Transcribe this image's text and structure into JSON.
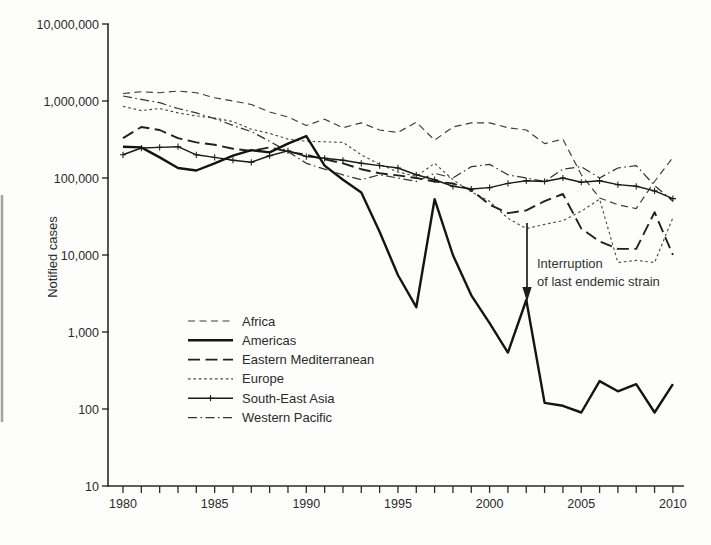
{
  "figure": {
    "background": "#fdfdfb",
    "ink": "#1a1a1a",
    "kind": "log-scale line chart of notified cases by WHO region, 1980-2010"
  },
  "y_axis": {
    "label": "Notified cases",
    "scale": "log",
    "tick_labels": [
      "10,000,000",
      "1,000,000",
      "100,000",
      "10,000",
      "1,000",
      "100",
      "10"
    ],
    "tick_values": [
      10000000,
      1000000,
      100000,
      10000,
      1000,
      100,
      10
    ]
  },
  "x_axis": {
    "range": [
      1980,
      2010
    ],
    "minor_tick_every": 1,
    "tick_labels": [
      "1980",
      "1985",
      "1990",
      "1995",
      "2000",
      "2005",
      "2010"
    ],
    "tick_label_values": [
      1980,
      1985,
      1990,
      1995,
      2000,
      2005,
      2010
    ]
  },
  "annotation": {
    "line1": "Interruption",
    "line2": "of last endemic strain",
    "arrow_year": 2002,
    "arrow_series": "Americas"
  },
  "legend": {
    "position": "inside-left-center",
    "entries": [
      "Africa",
      "Americas",
      "Eastern Mediterranean",
      "Europe",
      "South-East Asia",
      "Western Pacific"
    ]
  },
  "chart_data": {
    "type": "line",
    "y_scale": "log",
    "ylim": [
      10,
      10000000
    ],
    "xlim": [
      1980,
      2010
    ],
    "grid": false,
    "xlabel": "",
    "ylabel": "Notified cases",
    "x": [
      1980,
      1981,
      1982,
      1983,
      1984,
      1985,
      1986,
      1987,
      1988,
      1989,
      1990,
      1991,
      1992,
      1993,
      1994,
      1995,
      1996,
      1997,
      1998,
      1999,
      2000,
      2001,
      2002,
      2003,
      2004,
      2005,
      2006,
      2007,
      2008,
      2009,
      2010
    ],
    "series": [
      {
        "name": "Africa",
        "line_style": "medium-dash",
        "values": [
          1250000,
          1320000,
          1280000,
          1350000,
          1280000,
          1100000,
          1000000,
          900000,
          720000,
          620000,
          480000,
          580000,
          450000,
          520000,
          420000,
          390000,
          530000,
          310000,
          460000,
          520000,
          520000,
          450000,
          420000,
          280000,
          320000,
          110000,
          55000,
          45000,
          40000,
          90000,
          185000
        ]
      },
      {
        "name": "Americas",
        "line_style": "solid-thick",
        "values": [
          255000,
          250000,
          185000,
          135000,
          125000,
          155000,
          195000,
          230000,
          215000,
          280000,
          350000,
          145000,
          95000,
          65000,
          20000,
          5500,
          2100,
          53000,
          10000,
          3000,
          1300,
          540,
          2600,
          120,
          110,
          90,
          230,
          170,
          210,
          90,
          210
        ]
      },
      {
        "name": "Eastern Mediterranean",
        "line_style": "long-dash",
        "values": [
          330000,
          460000,
          420000,
          330000,
          290000,
          270000,
          240000,
          225000,
          250000,
          220000,
          200000,
          175000,
          155000,
          130000,
          115000,
          108000,
          100000,
          90000,
          85000,
          70000,
          45000,
          35000,
          38000,
          50000,
          62000,
          22000,
          15000,
          12000,
          12000,
          36000,
          10000
        ]
      },
      {
        "name": "Europe",
        "line_style": "fine-dash",
        "values": [
          850000,
          750000,
          800000,
          700000,
          640000,
          600000,
          540000,
          430000,
          380000,
          320000,
          300000,
          295000,
          290000,
          200000,
          150000,
          120000,
          105000,
          155000,
          95000,
          66000,
          50000,
          30000,
          22000,
          25000,
          28000,
          37000,
          53000,
          8000,
          8500,
          8000,
          30600
        ]
      },
      {
        "name": "South-East Asia",
        "line_style": "solid-plus",
        "values": [
          200000,
          245000,
          250000,
          255000,
          200000,
          185000,
          170000,
          160000,
          195000,
          225000,
          190000,
          180000,
          170000,
          155000,
          145000,
          135000,
          110000,
          95000,
          78000,
          72000,
          75000,
          85000,
          92000,
          90000,
          100000,
          88000,
          92000,
          82000,
          78000,
          68000,
          54000
        ]
      },
      {
        "name": "Western Pacific",
        "line_style": "dash-dot",
        "values": [
          1160000,
          1050000,
          950000,
          800000,
          700000,
          590000,
          480000,
          400000,
          300000,
          220000,
          155000,
          130000,
          110000,
          95000,
          110000,
          100000,
          90000,
          115000,
          100000,
          140000,
          150000,
          110000,
          100000,
          90000,
          130000,
          140000,
          100000,
          135000,
          145000,
          80000,
          50000
        ]
      }
    ]
  }
}
